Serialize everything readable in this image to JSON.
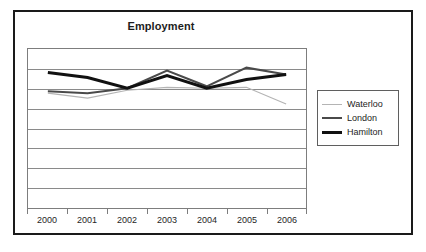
{
  "chart_data": {
    "type": "line",
    "title": "Employment",
    "xlabel": "",
    "ylabel": "",
    "grid": true,
    "legend_position": "right",
    "x": [
      "2000",
      "2001",
      "2002",
      "2003",
      "2004",
      "2005",
      "2006"
    ],
    "categories": [
      "2000",
      "2001",
      "2002",
      "2003",
      "2004",
      "2005",
      "2006"
    ],
    "ylim": [
      0,
      8
    ],
    "y_gridline_count": 9,
    "y_tick_labels": [],
    "series": [
      {
        "name": "Waterloo",
        "color": "#b4b4b4",
        "values": [
          5.75,
          5.5,
          5.9,
          6.05,
          6.0,
          6.05,
          5.2
        ]
      },
      {
        "name": "London",
        "color": "#4a4a4a",
        "values": [
          5.85,
          5.75,
          6.0,
          6.9,
          6.1,
          7.05,
          6.7
        ]
      },
      {
        "name": "Hamilton",
        "color": "#111111",
        "values": [
          6.8,
          6.55,
          6.0,
          6.65,
          6.0,
          6.45,
          6.7
        ]
      }
    ]
  },
  "legend": {
    "entries": [
      {
        "label": "Waterloo"
      },
      {
        "label": "London"
      },
      {
        "label": "Hamilton"
      }
    ]
  },
  "colors": {
    "frame": "#1a1a1a",
    "plot_border": "#7d7d7d",
    "gridline": "#8a8a8a",
    "background": "#ffffff",
    "waterloo": "#b4b4b4",
    "london": "#4a4a4a",
    "hamilton": "#111111"
  }
}
